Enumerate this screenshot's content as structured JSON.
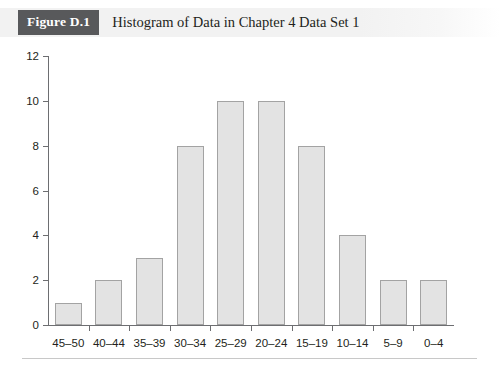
{
  "header": {
    "badge": "Figure D.1",
    "title": "Histogram of Data in Chapter 4 Data Set 1",
    "badge_color": "#58595b",
    "band_color": "#f2f2f2"
  },
  "chart_data": {
    "type": "bar",
    "title": "Histogram of Data in Chapter 4 Data Set 1",
    "xlabel": "",
    "ylabel": "",
    "categories": [
      "45–50",
      "40–44",
      "35–39",
      "30–34",
      "25–29",
      "20–24",
      "15–19",
      "10–14",
      "5–9",
      "0–4"
    ],
    "values": [
      1,
      2,
      3,
      8,
      10,
      10,
      8,
      4,
      2,
      2
    ],
    "ylim": [
      0,
      12
    ],
    "yticks": [
      0,
      2,
      4,
      6,
      8,
      10,
      12
    ],
    "ytick_labels": [
      "0",
      "2",
      "4",
      "6",
      "8",
      "10",
      "12"
    ],
    "grid": false,
    "legend": false,
    "bar_fill": "#e3e3e3",
    "bar_border": "#a3a3a3",
    "axis_color": "#6d6e71"
  }
}
